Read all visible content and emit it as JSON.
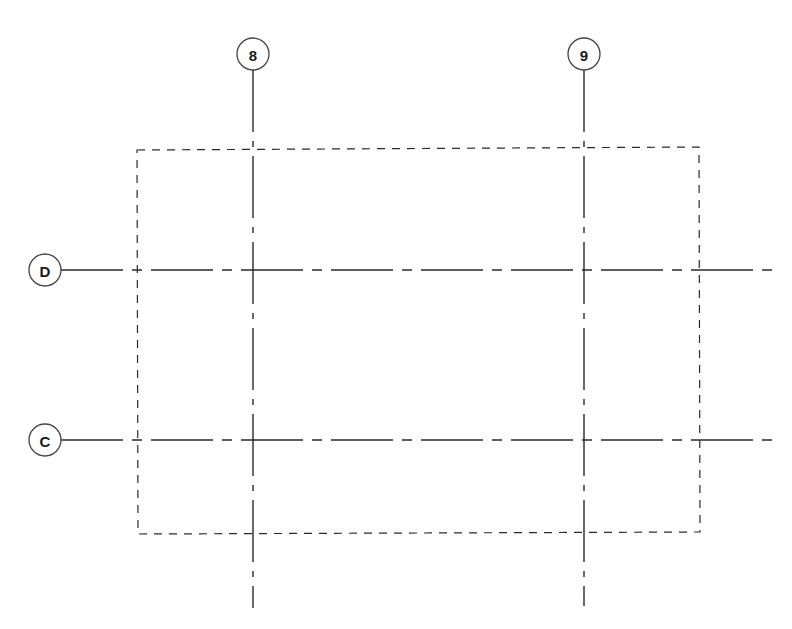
{
  "diagram": {
    "type": "structural-grid-plan",
    "colors": {
      "background": "#ffffff",
      "line": "#2a2a2a",
      "bubble_stroke": "#444444"
    },
    "vertical_grids": [
      {
        "label": "8",
        "x": 253,
        "bubble_cy": 54,
        "line_top": 70,
        "line_bottom": 608
      },
      {
        "label": "9",
        "x": 584,
        "bubble_cy": 54,
        "line_top": 70,
        "line_bottom": 606
      }
    ],
    "horizontal_grids": [
      {
        "label": "D",
        "y": 270,
        "bubble_cx": 45,
        "line_left": 61,
        "line_right": 775
      },
      {
        "label": "C",
        "y": 440,
        "bubble_cx": 45,
        "line_left": 61,
        "line_right": 775
      }
    ],
    "bubble_radius": 16,
    "dashed_outline": {
      "points": [
        [
          137,
          150
        ],
        [
          699,
          147
        ],
        [
          700,
          532
        ],
        [
          138,
          534
        ]
      ]
    }
  }
}
